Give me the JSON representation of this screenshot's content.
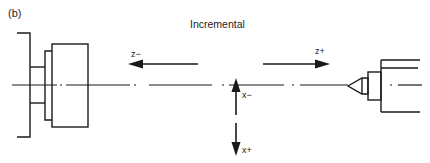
{
  "figure": {
    "panel_label": "(b)",
    "title": "Incremental"
  },
  "axes": {
    "z_minus": {
      "label": "z−",
      "direction": "left"
    },
    "z_plus": {
      "label": "z+",
      "direction": "right"
    },
    "x_minus": {
      "label": "x−",
      "direction": "up"
    },
    "x_plus": {
      "label": "x+",
      "direction": "down"
    }
  },
  "components": {
    "left": "chuck / spindle",
    "right": "tailstock center",
    "centerline": "spindle axis (dash-dot)"
  },
  "colors": {
    "stroke": "#1a1a1a",
    "background": "#ffffff"
  }
}
